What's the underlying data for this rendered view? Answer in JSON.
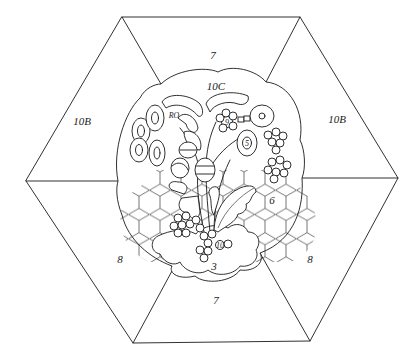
{
  "diagram": {
    "type": "quilt-block-pattern",
    "shape": "hexagon",
    "colors": {
      "line": "#1a1a1a",
      "background": "#ffffff"
    },
    "labels": {
      "top_trapezoid": "7",
      "bottom_trapezoid": "7",
      "upper_left_triangle": "10B",
      "upper_right_triangle": "10B",
      "lower_left_triangle": "8",
      "lower_right_triangle": "8",
      "medallion_top": "10C",
      "leaf_left": "RO",
      "flower_top": "9",
      "flower_right": "5",
      "honeycomb_right": "6",
      "cloud_bottom": "3",
      "small_flower": "10"
    }
  }
}
